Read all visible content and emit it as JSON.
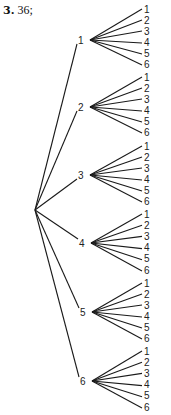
{
  "problem": {
    "number": "3.",
    "answer": "36;"
  },
  "chart_data": {
    "type": "tree",
    "root": "",
    "first_level": [
      "1",
      "2",
      "3",
      "4",
      "5",
      "6"
    ],
    "second_level_per_branch": [
      "1",
      "2",
      "3",
      "4",
      "5",
      "6"
    ],
    "total_outcomes": 36
  },
  "tree": {
    "root": {
      "x": 35,
      "y": 210
    },
    "branches": [
      {
        "label": "1",
        "x": 83,
        "y": 40,
        "leaves_top": 10,
        "leaves_bottom": 65
      },
      {
        "label": "2",
        "x": 83,
        "y": 107,
        "leaves_top": 78,
        "leaves_bottom": 133
      },
      {
        "label": "3",
        "x": 83,
        "y": 175,
        "leaves_top": 147,
        "leaves_bottom": 202
      },
      {
        "label": "4",
        "x": 84,
        "y": 243,
        "leaves_top": 215,
        "leaves_bottom": 271
      },
      {
        "label": "5",
        "x": 85,
        "y": 312,
        "leaves_top": 284,
        "leaves_bottom": 339
      },
      {
        "label": "6",
        "x": 85,
        "y": 381,
        "leaves_top": 352,
        "leaves_bottom": 408
      }
    ],
    "leaf_labels": [
      "1",
      "2",
      "3",
      "4",
      "5",
      "6"
    ],
    "leaf_x": 144,
    "line_color": "#1a1a1a"
  }
}
